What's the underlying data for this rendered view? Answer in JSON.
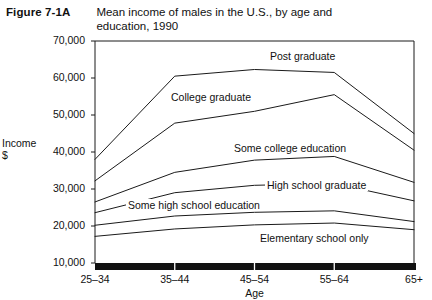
{
  "figure": {
    "number": "Figure 7-1A",
    "title": "Mean income of males in the U.S., by age and education, 1990"
  },
  "chart_data": {
    "type": "line",
    "title": "Mean income of males in the U.S., by age and education, 1990",
    "xlabel": "Age",
    "ylabel": "Income $",
    "ylabel_line1": "Income",
    "ylabel_line2": "$",
    "categories": [
      "25–34",
      "35–44",
      "45–54",
      "55–64",
      "65+"
    ],
    "ytick_labels": [
      "70,000",
      "60,000",
      "50,000",
      "40,000",
      "30,000",
      "20,000",
      "10,000"
    ],
    "yticks": [
      70000,
      60000,
      50000,
      40000,
      30000,
      20000,
      10000
    ],
    "ylim": [
      10000,
      70000
    ],
    "grid": false,
    "legend_position": "inline-labels",
    "line_color": "#1a1a1a",
    "series": [
      {
        "name": "Post graduate",
        "values": [
          38000,
          60500,
          62300,
          61500,
          45000
        ],
        "label": "Post graduate",
        "label_x": 268,
        "label_y": 50
      },
      {
        "name": "College graduate",
        "values": [
          32200,
          47800,
          51000,
          55500,
          40500
        ],
        "label": "College graduate",
        "label_x": 169,
        "label_y": 91
      },
      {
        "name": "Some college education",
        "values": [
          26500,
          34500,
          37800,
          38800,
          31800
        ],
        "label": "Some college education",
        "label_x": 232,
        "label_y": 142
      },
      {
        "name": "High school graduate",
        "values": [
          23600,
          29000,
          31000,
          31500,
          26800
        ],
        "label": "High school graduate",
        "label_x": 265,
        "label_y": 179
      },
      {
        "name": "Some high school education",
        "values": [
          20200,
          22700,
          23700,
          24100,
          21200
        ],
        "label": "Some high school education",
        "label_x": 126,
        "label_y": 199
      },
      {
        "name": "Elementary school only",
        "values": [
          17200,
          19200,
          20300,
          20800,
          19000
        ],
        "label": "Elementary school only",
        "label_x": 258,
        "label_y": 232
      }
    ]
  }
}
